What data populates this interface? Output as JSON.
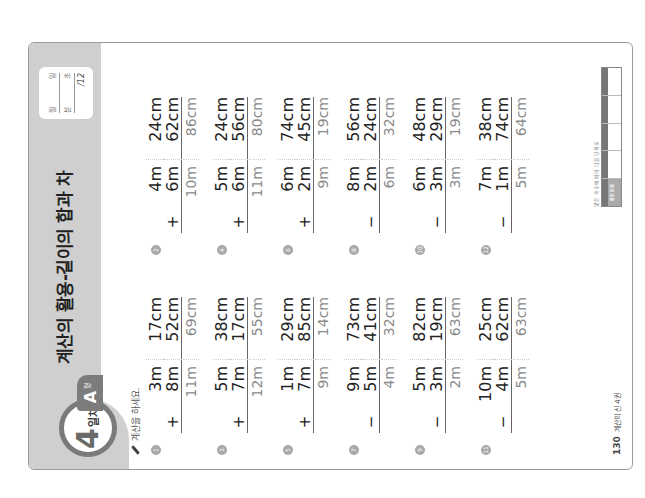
{
  "header": {
    "day_number": "4",
    "day_unit": "일차",
    "level": "A",
    "level_unit": "형",
    "title": "계산의 활용-길이의 합과 차",
    "score_box": {
      "date_labels": [
        "월",
        "일"
      ],
      "time_labels": [
        "분",
        "초"
      ],
      "score_total": "/12"
    }
  },
  "instruction": "계산을 하세요.",
  "problems": [
    {
      "num": "1",
      "op": "+",
      "a_m": "3m",
      "a_cm": "17cm",
      "b_m": "8m",
      "b_cm": "52cm",
      "ans_m": "11m",
      "ans_cm": "69cm"
    },
    {
      "num": "2",
      "op": "+",
      "a_m": "4m",
      "a_cm": "24cm",
      "b_m": "6m",
      "b_cm": "62cm",
      "ans_m": "10m",
      "ans_cm": "86cm"
    },
    {
      "num": "3",
      "op": "+",
      "a_m": "5m",
      "a_cm": "38cm",
      "b_m": "7m",
      "b_cm": "17cm",
      "ans_m": "12m",
      "ans_cm": "55cm"
    },
    {
      "num": "4",
      "op": "+",
      "a_m": "5m",
      "a_cm": "24cm",
      "b_m": "6m",
      "b_cm": "56cm",
      "ans_m": "11m",
      "ans_cm": "80cm"
    },
    {
      "num": "5",
      "op": "+",
      "a_m": "1m",
      "a_cm": "29cm",
      "b_m": "7m",
      "b_cm": "85cm",
      "ans_m": "9m",
      "ans_cm": "14cm"
    },
    {
      "num": "6",
      "op": "+",
      "a_m": "6m",
      "a_cm": "74cm",
      "b_m": "2m",
      "b_cm": "45cm",
      "ans_m": "9m",
      "ans_cm": "19cm"
    },
    {
      "num": "7",
      "op": "−",
      "a_m": "9m",
      "a_cm": "73cm",
      "b_m": "5m",
      "b_cm": "41cm",
      "ans_m": "4m",
      "ans_cm": "32cm"
    },
    {
      "num": "8",
      "op": "−",
      "a_m": "8m",
      "a_cm": "56cm",
      "b_m": "2m",
      "b_cm": "24cm",
      "ans_m": "6m",
      "ans_cm": "32cm"
    },
    {
      "num": "9",
      "op": "−",
      "a_m": "5m",
      "a_cm": "82cm",
      "b_m": "3m",
      "b_cm": "19cm",
      "ans_m": "2m",
      "ans_cm": "63cm"
    },
    {
      "num": "10",
      "op": "−",
      "a_m": "6m",
      "a_cm": "48cm",
      "b_m": "3m",
      "b_cm": "29cm",
      "ans_m": "3m",
      "ans_cm": "19cm"
    },
    {
      "num": "11",
      "op": "−",
      "a_m": "10m",
      "a_cm": "25cm",
      "b_m": "4m",
      "b_cm": "62cm",
      "ans_m": "5m",
      "ans_cm": "63cm"
    },
    {
      "num": "12",
      "op": "−",
      "a_m": "7m",
      "a_cm": "38cm",
      "b_m": "1m",
      "b_cm": "74cm",
      "ans_m": "5m",
      "ans_cm": "64cm"
    }
  ],
  "footer": {
    "page_number": "130",
    "book_title": "계산의 신 4권",
    "guide_caption": "맞은 개수에 따라 다음 단계로",
    "guide_cells": [
      "틀린 문제",
      "",
      "",
      "",
      ""
    ]
  },
  "colors": {
    "header_band": "#cfcfcf",
    "badge_ring": "#7a7a7a",
    "level_tab": "#7c7c7c",
    "answer_text": "#8a8a8a"
  }
}
